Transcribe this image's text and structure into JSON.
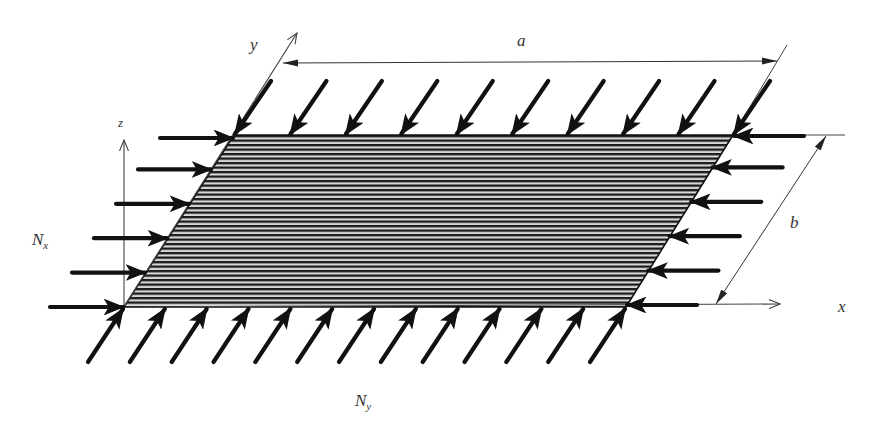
{
  "diagram": {
    "colors": {
      "background": "#ffffff",
      "ink": "#111111",
      "thin_line": "#444444",
      "hatch_light": "#d8d8d8",
      "hatch_dark": "#1a1a1a",
      "label": "#333333"
    },
    "plate": {
      "corners": {
        "top_left": [
          234,
          135
        ],
        "top_right": [
          733,
          135
        ],
        "bottom_right": [
          626,
          307
        ],
        "bottom_left": [
          124,
          307
        ]
      },
      "hatch_period_px": 4.5,
      "hatch_orientation": "horizontal"
    },
    "axes": {
      "x": {
        "label": "x",
        "from": [
          124,
          307
        ],
        "to": [
          780,
          304
        ],
        "label_pos": [
          838,
          312
        ]
      },
      "y": {
        "label": "y",
        "from": [
          124,
          307
        ],
        "to": [
          297,
          33
        ],
        "label_pos": [
          250,
          50
        ]
      },
      "z": {
        "label": "z",
        "from": [
          124,
          307
        ],
        "to": [
          124,
          140
        ],
        "label_pos": [
          118,
          127
        ]
      }
    },
    "dimensions": {
      "a": {
        "label": "a",
        "from": [
          283,
          63
        ],
        "to": [
          777,
          61
        ],
        "label_pos": [
          517,
          46
        ]
      },
      "b": {
        "label": "b",
        "from": [
          826,
          136
        ],
        "to": [
          716,
          304
        ],
        "label_pos": [
          790,
          228
        ]
      },
      "extension_lines": [
        {
          "from": [
            733,
            135
          ],
          "to": [
            787,
            45
          ]
        },
        {
          "from": [
            733,
            135
          ],
          "to": [
            845,
            135
          ]
        }
      ]
    },
    "loads": {
      "Nx": {
        "label_main": "N",
        "label_sub": "x",
        "label_pos": [
          32,
          245
        ],
        "left_arrows_count": 6,
        "right_arrows_count": 6,
        "direction": "compressive, along x"
      },
      "Ny": {
        "label_main": "N",
        "label_sub": "y",
        "label_pos": [
          355,
          406
        ],
        "top_arrows_count": 10,
        "bottom_arrows_count": 13,
        "direction": "compressive, along y"
      }
    }
  }
}
